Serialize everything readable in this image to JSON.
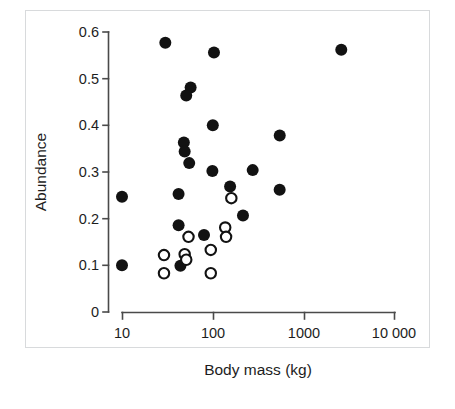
{
  "chart": {
    "type": "scatter",
    "title": "",
    "xlabel": "Body mass (kg)",
    "ylabel": "Abundance",
    "x_ticks": [
      "10",
      "100",
      "1000",
      "10 000"
    ],
    "y_ticks": [
      "0.6",
      "0.5",
      "0.4",
      "0.3",
      "0.2",
      "0.1",
      "0"
    ]
  },
  "chart_data": {
    "type": "scatter",
    "title": "",
    "xlabel": "Body mass (kg)",
    "ylabel": "Abundance",
    "xscale": "log",
    "yscale": "linear",
    "xlim": [
      10,
      10000
    ],
    "ylim": [
      0,
      0.6
    ],
    "xticks": [
      10,
      100,
      1000,
      10000
    ],
    "xticklabels": [
      "10",
      "100",
      "1000",
      "10 000"
    ],
    "yticks": [
      0,
      0.1,
      0.2,
      0.3,
      0.4,
      0.5,
      0.6
    ],
    "yticklabels": [
      "0",
      "0.1",
      "0.2",
      "0.3",
      "0.4",
      "0.5",
      "0.6"
    ],
    "grid": false,
    "legend": null,
    "marker_colors": {
      "filled": "#121212",
      "open_edge": "#121212",
      "open_fill": "#ffffff",
      "axis": "#4a4a4a",
      "frame": "#d8dadc",
      "background": "#ffffff"
    },
    "series": [
      {
        "name": "filled",
        "marker": "filled-circle",
        "points": [
          {
            "x": 30,
            "y": 0.577
          },
          {
            "x": 103,
            "y": 0.556
          },
          {
            "x": 2600,
            "y": 0.562
          },
          {
            "x": 57,
            "y": 0.481
          },
          {
            "x": 51,
            "y": 0.464
          },
          {
            "x": 100,
            "y": 0.4
          },
          {
            "x": 546,
            "y": 0.378
          },
          {
            "x": 48,
            "y": 0.363
          },
          {
            "x": 49,
            "y": 0.344
          },
          {
            "x": 55,
            "y": 0.319
          },
          {
            "x": 99,
            "y": 0.302
          },
          {
            "x": 275,
            "y": 0.304
          },
          {
            "x": 155,
            "y": 0.269
          },
          {
            "x": 545,
            "y": 0.262
          },
          {
            "x": 10,
            "y": 0.247
          },
          {
            "x": 42,
            "y": 0.253
          },
          {
            "x": 215,
            "y": 0.207
          },
          {
            "x": 42,
            "y": 0.186
          },
          {
            "x": 80,
            "y": 0.165
          },
          {
            "x": 10,
            "y": 0.1
          },
          {
            "x": 44,
            "y": 0.099
          }
        ]
      },
      {
        "name": "open",
        "marker": "open-circle",
        "points": [
          {
            "x": 160,
            "y": 0.244
          },
          {
            "x": 137,
            "y": 0.181
          },
          {
            "x": 140,
            "y": 0.161
          },
          {
            "x": 54,
            "y": 0.161
          },
          {
            "x": 95,
            "y": 0.133
          },
          {
            "x": 29,
            "y": 0.122
          },
          {
            "x": 49,
            "y": 0.124
          },
          {
            "x": 51,
            "y": 0.112
          },
          {
            "x": 29,
            "y": 0.083
          },
          {
            "x": 95,
            "y": 0.083
          }
        ]
      }
    ]
  }
}
